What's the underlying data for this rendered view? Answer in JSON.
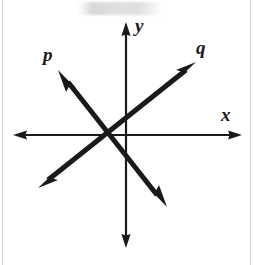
{
  "figure": {
    "type": "coordinate-plane-line-diagram",
    "background_color": "#ffffff",
    "ink_color": "#1a1a1a",
    "width": 253,
    "height": 265,
    "origin": {
      "x": 126,
      "y": 135
    },
    "axes": {
      "x": {
        "label": "x",
        "label_position": {
          "x": 221,
          "y": 105
        },
        "y_pixel": 135,
        "from": {
          "x": 13,
          "y": 135
        },
        "to": {
          "x": 242,
          "y": 135
        },
        "arrow_start": true,
        "arrow_end": true,
        "stroke_width": 2.2
      },
      "y": {
        "label": "y",
        "label_position": {
          "x": 135,
          "y": 16
        },
        "x_pixel": 126,
        "from": {
          "x": 126,
          "y": 22
        },
        "to": {
          "x": 126,
          "y": 248
        },
        "arrow_start": true,
        "arrow_end": true,
        "stroke_width": 2.2
      }
    },
    "lines": [
      {
        "name": "p",
        "label": "p",
        "label_position": {
          "x": 43,
          "y": 45
        },
        "description": "negative-slope line through the intersection point, arrowheads at both ends",
        "from": {
          "x": 58,
          "y": 70
        },
        "to": {
          "x": 167,
          "y": 207
        },
        "slope_sign": "negative",
        "arrow_start": true,
        "arrow_end": true,
        "stroke_width": 5
      },
      {
        "name": "q",
        "label": "q",
        "label_position": {
          "x": 196,
          "y": 38
        },
        "description": "positive-slope line through the intersection point, arrowheads at both ends",
        "from": {
          "x": 38,
          "y": 188
        },
        "to": {
          "x": 196,
          "y": 62
        },
        "slope_sign": "positive",
        "arrow_start": true,
        "arrow_end": true,
        "stroke_width": 5
      }
    ],
    "intersection": {
      "x": 105,
      "y": 133
    },
    "artifacts": {
      "top_smudge": true,
      "left_edge_rule": true,
      "right_edge_rule": true
    }
  }
}
